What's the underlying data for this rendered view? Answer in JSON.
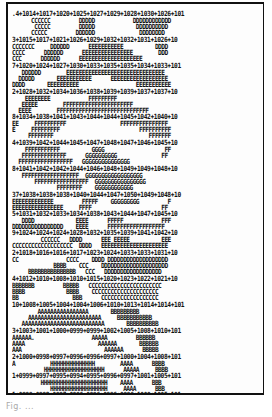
{
  "figure": {
    "type": "character-printed pressure contour map",
    "symbol_legend": [
      "A",
      "B",
      "C",
      "D",
      "E",
      "F",
      "G",
      "H"
    ],
    "caption": "Fig. ..."
  },
  "rows": [
    {
      "top": 2,
      "text": ".4+1014+1017+1020+1025+1027+1029+1028+1030+1026+101",
      "kind": "num"
    },
    {
      "top": 9,
      "text": "      CCCCCC         DDDDD            DDDDDDDDDDDD"
    },
    {
      "top": 15,
      "text": "       CCCCC         DDDDD             DDDDDDDDDD"
    },
    {
      "top": 21,
      "text": "      CCCCC         DDDDDD              DDDDDDDD"
    },
    {
      "top": 28,
      "text": "3+1015+1017+1021+1026+1029+1032+1032+1031+1026+10",
      "kind": "num"
    },
    {
      "top": 35,
      "text": "CCCCCCC     DDDDDD      EEEEEEEEEEE          DDDD"
    },
    {
      "top": 41,
      "text": "CCCC      DDDDDD      EEEEEEEEEEEEEEEE        DDD"
    },
    {
      "top": 47,
      "text": "CCC      DDDDDD      EEEEEEEEEEEEEEEEEEEE"
    },
    {
      "top": 54,
      "text": "7+1020+1024+1027+1030+1033+1035+1035+1034+1033+101",
      "kind": "num"
    },
    {
      "top": 61,
      "text": "   DDDDDD        EEEEEEEEEEEEEEEEEEEEEEEEEEEEEEE"
    },
    {
      "top": 67,
      "text": "  DDDDD       EEEEEEEEEEE      EEEEEEEEEEEEEEEEEE"
    },
    {
      "top": 73,
      "text": "DDDD       EEEEEEEEEE                  EEEEEEEEEEE"
    },
    {
      "top": 80,
      "text": "2+1028+1032+1034+1036+1038+1039+1039+1037+1037+10",
      "kind": "num"
    },
    {
      "top": 87,
      "text": "    EEEEEEEE            FFFFFFFFF"
    },
    {
      "top": 93,
      "text": "   EEEEE        FFFFFFFFFFFFFFFFFFFFFF"
    },
    {
      "top": 99,
      "text": "  EEEE        FFFFFFFFFFFFFFFFFFFFFFFFFFFFF"
    },
    {
      "top": 105,
      "text": "8+1034+1038+1041+1043+1044+1044+1045+1042+1040+10",
      "kind": "num"
    },
    {
      "top": 112,
      "text": "EE     FFFFFFFFFF                 FFFFFFFFFFFFFFF"
    },
    {
      "top": 118,
      "text": "E     FFFFFFFFF                         FFFFFFFFFF"
    },
    {
      "top": 124,
      "text": "     FFFFFFFF                              FFFFFFF"
    },
    {
      "top": 131,
      "text": "4+1039+1042+1044+1045+1047+1048+1047+1046+1045+10",
      "kind": "num"
    },
    {
      "top": 138,
      "text": "    FFFFFFFFFFF          GGGG                   FF"
    },
    {
      "top": 144,
      "text": "   FFFFFFFFFFFFFF      GGGGGGGGGG              FF"
    },
    {
      "top": 150,
      "text": "  FFFFFFFFFFFFFFFFF   GGGGGGGGGGGGGGG"
    },
    {
      "top": 157,
      "text": "8+1041+1042+1042+1044+1046+1048+1049+1049+1048+10",
      "kind": "num"
    },
    {
      "top": 164,
      "text": "   FFFFFFFFFFFFFFFFFF  GGGGGGGGGGGGGGGGGG"
    },
    {
      "top": 170,
      "text": "       FFFFFFFFFFFFFFFFF  GGGGGGGGGGGGGGGG"
    },
    {
      "top": 176,
      "text": "              FFFFFFFF    GGGGGGGGGGGG"
    },
    {
      "top": 183,
      "text": "37+1038+1038+1038+1040+1044+1047+1050+1049+1048+10",
      "kind": "num"
    },
    {
      "top": 190,
      "text": "EEEEEEEEEEEEE         FFFFF    GGGGGGGGG         F"
    },
    {
      "top": 196,
      "text": "EEEEEEEEEEEEEEEE     FFFF                      FF"
    },
    {
      "top": 202,
      "text": "5+1031+1032+1033+1034+1038+1043+1044+1047+1045+10",
      "kind": "num"
    },
    {
      "top": 209,
      "text": "   DDDD             EEEE      FFFFF            FFF"
    },
    {
      "top": 215,
      "text": "DDDDDDDDDDDDDDDD    EEEE      FFFFFFFFFFFFFFFFFF"
    },
    {
      "top": 221,
      "text": "9+1024+1024+1024+1028+1032+1035+1039+1041+1042+10",
      "kind": "num"
    },
    {
      "top": 228,
      "text": "         CCCCCC   DDDD      EEE EEEEE          EEE"
    },
    {
      "top": 234,
      "text": "CCCCCCCCCCCCCCCCCCC  DDDD   EEEEEEEEEEEEEEEEEEEEE"
    },
    {
      "top": 241,
      "text": "2+1018+1016+1016+1017+1023+1024+1033+1033+1031+10",
      "kind": "num"
    },
    {
      "top": 248,
      "text": "CC               CCCC    DDDD DDDDDDDDDDDDDDDDDDD"
    },
    {
      "top": 254,
      "text": "             BBBB    CCC    DDDDDDDDDDDDDDDDDDDDD"
    },
    {
      "top": 260,
      "text": "     BBBBBBBBBBBBBBB   CCC   DDDDDDDDDDDDDDDDDD"
    },
    {
      "top": 267,
      "text": "4+1012+1010+1008+1010+1015+1020+1023+1022+1021+10",
      "kind": "num"
    },
    {
      "top": 274,
      "text": "BBBBBBB         BBBBB   CCCCCCCCCCCCCCCCCCCCCCC"
    },
    {
      "top": 280,
      "text": "BBBB             BBBB    CCCCCCCCCCCCCCCCCCCCC"
    },
    {
      "top": 286,
      "text": "BB                 BBB      CCCCCCCCCCCCCCCCCC"
    },
    {
      "top": 293,
      "text": "10+1008+1005+1004+1004+1006+1010+1013+1014+1014+101",
      "kind": "num"
    },
    {
      "top": 300,
      "text": "        AAAAAAAAAAAAAAAA       BBBBBBBBB"
    },
    {
      "top": 306,
      "text": "     AAAAAAAAAAAAAAAAAAAAAAA     BBBBBBBBBBB"
    },
    {
      "top": 312,
      "text": "   AAAAAAAAAAAAAAAAAAAAAAAAAA       BBBBBBBBBB"
    },
    {
      "top": 319,
      "text": "3+1003+1001+1000+0999+0999+1002+1005+1008+1010+101",
      "kind": "num"
    },
    {
      "top": 326,
      "text": "AAAAAA.                  AAAAA         BBBBBB"
    },
    {
      "top": 332,
      "text": "AAAA                       AAAAAA       BBBBBB"
    },
    {
      "top": 338,
      "text": "AAA                          AAAAAA      BBBBB"
    },
    {
      "top": 345,
      "text": "2+1000+0998+0997+0996+0996+0997+1000+1004+1008+101",
      "kind": "num"
    },
    {
      "top": 352,
      "text": "A           HHHHHHHHHHHHHH        AAAA      BBBB"
    },
    {
      "top": 358,
      "text": "          HHHHHHHHHHHHHHHHHHH      AAAAA     BBBB"
    },
    {
      "top": 364,
      "text": "1+0999+0997+0995+0994+0995+0996+0997+1001+1005+101",
      "kind": "num"
    },
    {
      "top": 371,
      "text": "         HHHHHHHHHHHHHHHHHHHHH    AAAA      BBB"
    },
    {
      "top": 377,
      "text": "            HHHHHHHHHHHHHHHHHH     AAAA      BBB"
    },
    {
      "top": 383,
      "text": "1+0999+0998+0997+0996+0996+0996+0996+1000+1005+101",
      "kind": "num"
    }
  ]
}
